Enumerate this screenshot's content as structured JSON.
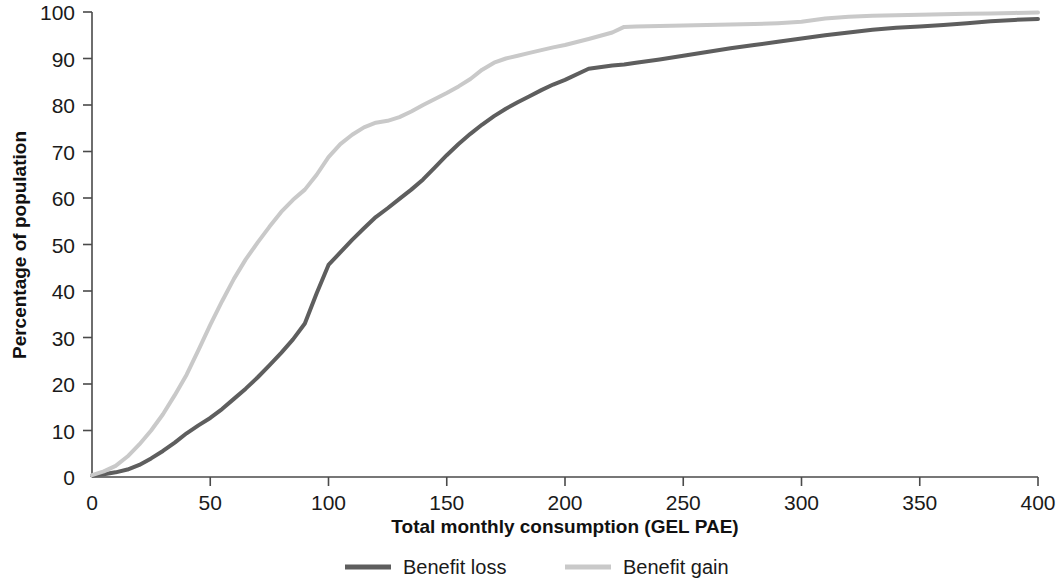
{
  "chart_data": {
    "type": "line",
    "title": "",
    "xlabel": "Total monthly consumption (GEL PAE)",
    "ylabel": "Percentage of population",
    "xlim": [
      0,
      400
    ],
    "ylim": [
      0,
      100
    ],
    "xticks": [
      "0",
      "50",
      "100",
      "150",
      "200",
      "250",
      "300",
      "350",
      "400"
    ],
    "yticks": [
      "0",
      "10",
      "20",
      "30",
      "40",
      "50",
      "60",
      "70",
      "80",
      "90",
      "100"
    ],
    "grid": false,
    "legend_position": "bottom",
    "x": [
      0,
      5,
      10,
      15,
      20,
      25,
      30,
      35,
      40,
      45,
      50,
      55,
      60,
      65,
      70,
      75,
      80,
      85,
      90,
      95,
      100,
      105,
      110,
      115,
      120,
      125,
      130,
      135,
      140,
      145,
      150,
      155,
      160,
      165,
      170,
      175,
      180,
      185,
      190,
      195,
      200,
      210,
      220,
      225,
      230,
      240,
      250,
      260,
      270,
      280,
      290,
      300,
      310,
      320,
      330,
      340,
      350,
      360,
      370,
      380,
      390,
      400
    ],
    "series": [
      {
        "name": "Benefit loss",
        "color": "#5e5e5e",
        "values": [
          0.3,
          0.6,
          1.0,
          1.6,
          2.6,
          4.0,
          5.6,
          7.4,
          9.4,
          11.1,
          12.7,
          14.6,
          16.8,
          19.0,
          21.4,
          24.0,
          26.7,
          29.6,
          33.0,
          39.5,
          45.6,
          48.3,
          51.0,
          53.5,
          55.9,
          57.8,
          59.8,
          61.8,
          64.0,
          66.6,
          69.2,
          71.6,
          73.8,
          75.8,
          77.6,
          79.2,
          80.6,
          81.9,
          83.2,
          84.4,
          85.4,
          87.8,
          88.5,
          88.7,
          89.1,
          89.8,
          90.6,
          91.4,
          92.2,
          92.9,
          93.6,
          94.3,
          95.0,
          95.6,
          96.2,
          96.6,
          96.9,
          97.2,
          97.6,
          98.0,
          98.3,
          98.5
        ]
      },
      {
        "name": "Benefit gain",
        "color": "#c9c9c9",
        "values": [
          0.4,
          1.2,
          2.4,
          4.4,
          7.0,
          10.0,
          13.5,
          17.6,
          22.0,
          27.3,
          32.7,
          37.8,
          42.6,
          46.8,
          50.4,
          53.8,
          57.0,
          59.6,
          61.8,
          65.0,
          68.8,
          71.6,
          73.6,
          75.2,
          76.2,
          76.6,
          77.4,
          78.6,
          80.0,
          81.3,
          82.6,
          84.0,
          85.6,
          87.6,
          89.1,
          90.0,
          90.6,
          91.2,
          91.8,
          92.4,
          92.9,
          94.2,
          95.6,
          96.8,
          96.9,
          97.0,
          97.1,
          97.2,
          97.3,
          97.4,
          97.6,
          97.9,
          98.6,
          99.0,
          99.2,
          99.3,
          99.4,
          99.5,
          99.6,
          99.7,
          99.8,
          99.9
        ]
      }
    ]
  },
  "legend": {
    "items": [
      {
        "label": "Benefit loss",
        "color": "#5e5e5e"
      },
      {
        "label": "Benefit gain",
        "color": "#c9c9c9"
      }
    ]
  }
}
